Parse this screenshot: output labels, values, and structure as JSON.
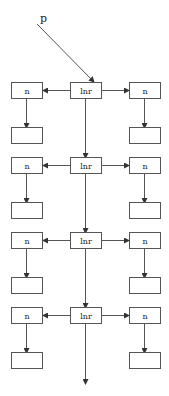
{
  "diagram": {
    "type": "linked-structure",
    "pointer": {
      "label": "p",
      "from": [
        37,
        24
      ],
      "to": [
        94,
        82
      ]
    },
    "colors": {
      "stroke": "#555555",
      "text": "#222222",
      "background": "#ffffff"
    },
    "rows": [
      {
        "center_label": "lnr",
        "left_label": "n",
        "right_label": "n"
      },
      {
        "center_label": "lnr",
        "left_label": "n",
        "right_label": "n"
      },
      {
        "center_label": "lnr",
        "left_label": "n",
        "right_label": "n"
      },
      {
        "center_label": "lnr",
        "left_label": "n",
        "right_label": "n"
      }
    ]
  }
}
